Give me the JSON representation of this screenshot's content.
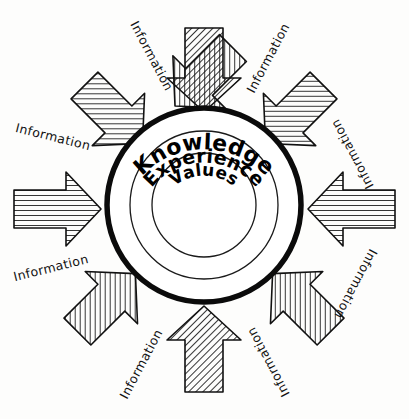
{
  "diagram": {
    "background_color": "#fdfdfc",
    "ink_color": "#111111",
    "center": {
      "x": 204,
      "y": 205
    },
    "rings": [
      {
        "name": "knowledge",
        "label": "Knowledge",
        "radius": 97,
        "stroke_width": 5.5,
        "label_font_size": 22
      },
      {
        "name": "experience",
        "label": "Experience",
        "radius": 74,
        "stroke_width": 1.3,
        "label_font_size": 19
      },
      {
        "name": "values",
        "label": "Values",
        "radius": 52,
        "stroke_width": 1.3,
        "label_font_size": 17
      }
    ],
    "arrow_label_text": "Information",
    "arrows": [
      {
        "id": "arrow-n",
        "label": "Information",
        "angle": 90,
        "label_x": 148,
        "label_y": 58,
        "label_rotate": -62
      },
      {
        "id": "arrow-ne",
        "label": "Information",
        "angle": 45,
        "label_x": 271,
        "label_y": 57,
        "label_rotate": 62
      },
      {
        "id": "arrow-e",
        "label": "Information",
        "angle": 0,
        "label_x": 352,
        "label_y": 150,
        "label_rotate": 116
      },
      {
        "id": "arrow-se",
        "label": "Information",
        "angle": -45,
        "label_x": 348,
        "label_y": 281,
        "label_rotate": -115
      },
      {
        "id": "arrow-s",
        "label": "Information",
        "angle": -90,
        "label_x": 270,
        "label_y": 360,
        "label_rotate": -62
      },
      {
        "id": "arrow-sw",
        "label": "Information",
        "angle": 180,
        "label_x": 143,
        "label_y": 364,
        "label_rotate": 62
      },
      {
        "id": "arrow-w",
        "label": "Information",
        "angle": 180,
        "label_x": 48,
        "label_y": 272,
        "label_rotate": -14
      },
      {
        "id": "arrow-nw",
        "label": "Information",
        "angle": 135,
        "label_x": 50,
        "label_y": 141,
        "label_rotate": 14
      }
    ]
  }
}
